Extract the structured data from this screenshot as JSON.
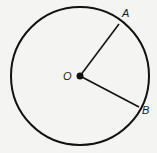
{
  "diagram": {
    "type": "circle-with-radii",
    "center": {
      "label": "O",
      "x": 80,
      "y": 76
    },
    "radius": 69,
    "points": [
      {
        "label": "A",
        "x": 119,
        "y": 24,
        "label_x": 122,
        "label_y": 17
      },
      {
        "label": "B",
        "x": 139,
        "y": 107,
        "label_x": 142,
        "label_y": 114
      }
    ],
    "center_label_pos": {
      "x": 63,
      "y": 80
    },
    "colors": {
      "stroke": "#111111",
      "background": "#f4f4f2"
    }
  }
}
